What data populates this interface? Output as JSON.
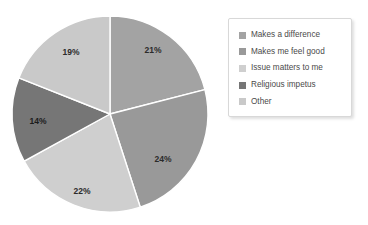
{
  "chart_data": {
    "type": "pie",
    "title": "",
    "subtitle": "",
    "xlabel": "",
    "ylabel": "",
    "grid": false,
    "legend_position": "right",
    "start_angle_deg": 0,
    "direction": "clockwise",
    "categories": [
      "Makes a difference",
      "Makes me feel good",
      "Issue matters to me",
      "Religious impetus",
      "Other"
    ],
    "values": [
      21,
      24,
      22,
      14,
      19
    ],
    "data_labels": [
      "21%",
      "24%",
      "22%",
      "14%",
      "19%"
    ],
    "colors": [
      "#a3a3a3",
      "#999999",
      "#cfcfcf",
      "#767676",
      "#c9c9c9"
    ],
    "slice_separator_color": "#ffffff",
    "units": "percent",
    "total": 100,
    "annotations": []
  },
  "pie": {
    "center_x": 110,
    "center_y": 114,
    "radius": 98,
    "slices": [
      {
        "label": "21%",
        "value": 21,
        "color": "#a3a3a3",
        "label_x": 153,
        "label_y": 53,
        "dark": false
      },
      {
        "label": "24%",
        "value": 24,
        "color": "#999999",
        "label_x": 163,
        "label_y": 162,
        "dark": false
      },
      {
        "label": "22%",
        "value": 22,
        "color": "#cfcfcf",
        "label_x": 82,
        "label_y": 194,
        "dark": false
      },
      {
        "label": "14%",
        "value": 14,
        "color": "#767676",
        "label_x": 38,
        "label_y": 124,
        "dark": true
      },
      {
        "label": "19%",
        "value": 19,
        "color": "#c9c9c9",
        "label_x": 71,
        "label_y": 55,
        "dark": false
      }
    ]
  },
  "legend": {
    "items": [
      {
        "label": "Makes a difference",
        "color": "#a3a3a3"
      },
      {
        "label": "Makes me feel good",
        "color": "#999999"
      },
      {
        "label": "Issue matters to me",
        "color": "#cfcfcf"
      },
      {
        "label": "Religious impetus",
        "color": "#767676"
      },
      {
        "label": "Other",
        "color": "#c9c9c9"
      }
    ]
  }
}
